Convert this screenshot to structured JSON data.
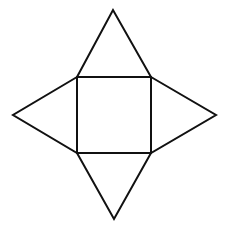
{
  "diagram": {
    "type": "square-pyramid-net",
    "stroke_color": "#111111",
    "background": "#ffffff",
    "stroke_width": 2,
    "square": {
      "x1": 77,
      "y1": 77,
      "x2": 151,
      "y2": 153
    },
    "apexes": {
      "top": [
        113,
        10
      ],
      "bottom": [
        114,
        219
      ],
      "left": [
        13,
        115
      ],
      "right": [
        216,
        115
      ]
    }
  }
}
